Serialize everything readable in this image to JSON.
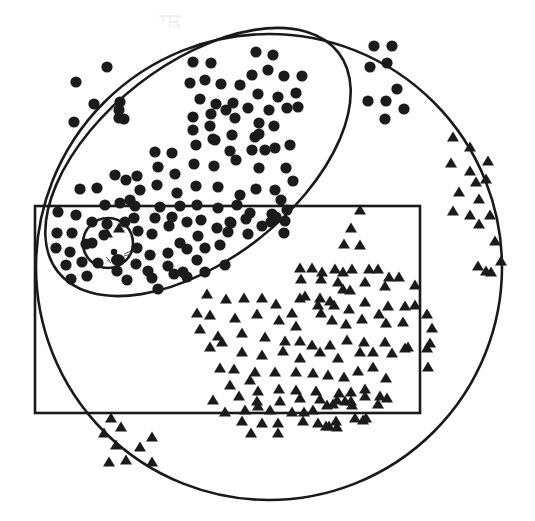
{
  "figure": {
    "colors": {
      "ink": "#1b1b1b",
      "paper": "#ffffff"
    },
    "shapes": {
      "big_circle": {
        "cx": 269,
        "cy": 267,
        "r": 233
      },
      "ellipse": {
        "cx": 198,
        "cy": 162,
        "rx": 178,
        "ry": 98,
        "rotate": -38
      },
      "rectangle": {
        "x": 35,
        "y": 206,
        "width": 385,
        "height": 207
      },
      "small_circle": {
        "cx": 108,
        "cy": 243,
        "r": 25
      }
    },
    "legend": {
      "dot": "filled circle marker",
      "triangle": "filled triangle marker",
      "animal": "small animal glyph (center of small circle)"
    },
    "dots": [
      [
        107,
        67
      ],
      [
        76,
        82
      ],
      [
        120,
        102
      ],
      [
        94,
        104
      ],
      [
        74,
        122
      ],
      [
        119,
        118
      ],
      [
        256,
        52
      ],
      [
        273,
        55
      ],
      [
        193,
        62
      ],
      [
        211,
        63
      ],
      [
        190,
        83
      ],
      [
        205,
        80
      ],
      [
        221,
        84
      ],
      [
        240,
        85
      ],
      [
        252,
        75
      ],
      [
        268,
        70
      ],
      [
        284,
        76
      ],
      [
        302,
        76
      ],
      [
        200,
        99
      ],
      [
        216,
        104
      ],
      [
        233,
        103
      ],
      [
        258,
        94
      ],
      [
        278,
        97
      ],
      [
        296,
        93
      ],
      [
        193,
        117
      ],
      [
        211,
        114
      ],
      [
        226,
        110
      ],
      [
        248,
        108
      ],
      [
        269,
        110
      ],
      [
        287,
        108
      ],
      [
        193,
        130
      ],
      [
        210,
        126
      ],
      [
        235,
        118
      ],
      [
        259,
        123
      ],
      [
        274,
        126
      ],
      [
        298,
        107
      ],
      [
        215,
        140
      ],
      [
        232,
        135
      ],
      [
        255,
        137
      ],
      [
        275,
        148
      ],
      [
        290,
        145
      ],
      [
        155,
        152
      ],
      [
        172,
        153
      ],
      [
        196,
        145
      ],
      [
        213,
        139
      ],
      [
        230,
        151
      ],
      [
        252,
        150
      ],
      [
        265,
        150
      ],
      [
        115,
        175
      ],
      [
        137,
        176
      ],
      [
        158,
        167
      ],
      [
        175,
        174
      ],
      [
        194,
        164
      ],
      [
        214,
        166
      ],
      [
        236,
        160
      ],
      [
        259,
        168
      ],
      [
        286,
        168
      ],
      [
        80,
        189
      ],
      [
        97,
        188
      ],
      [
        126,
        180
      ],
      [
        140,
        190
      ],
      [
        157,
        185
      ],
      [
        177,
        193
      ],
      [
        196,
        186
      ],
      [
        218,
        187
      ],
      [
        240,
        195
      ],
      [
        256,
        189
      ],
      [
        275,
        190
      ],
      [
        293,
        181
      ],
      [
        105,
        205
      ],
      [
        120,
        203
      ],
      [
        135,
        206
      ],
      [
        160,
        207
      ],
      [
        180,
        206
      ],
      [
        197,
        205
      ],
      [
        218,
        208
      ],
      [
        237,
        205
      ],
      [
        250,
        213
      ],
      [
        272,
        214
      ],
      [
        287,
        210
      ],
      [
        58,
        212
      ],
      [
        76,
        215
      ],
      [
        92,
        222
      ],
      [
        107,
        224
      ],
      [
        125,
        222
      ],
      [
        134,
        218
      ],
      [
        155,
        218
      ],
      [
        172,
        217
      ],
      [
        187,
        222
      ],
      [
        201,
        220
      ],
      [
        230,
        222
      ],
      [
        246,
        219
      ],
      [
        271,
        222
      ],
      [
        285,
        221
      ],
      [
        57,
        233
      ],
      [
        72,
        233
      ],
      [
        92,
        243
      ],
      [
        104,
        235
      ],
      [
        138,
        231
      ],
      [
        152,
        234
      ],
      [
        169,
        226
      ],
      [
        180,
        243
      ],
      [
        198,
        236
      ],
      [
        217,
        228
      ],
      [
        231,
        223
      ],
      [
        248,
        234
      ],
      [
        56,
        248
      ],
      [
        70,
        252
      ],
      [
        86,
        244
      ],
      [
        137,
        248
      ],
      [
        150,
        255
      ],
      [
        168,
        253
      ],
      [
        187,
        249
      ],
      [
        205,
        248
      ],
      [
        220,
        245
      ],
      [
        228,
        232
      ],
      [
        66,
        265
      ],
      [
        82,
        262
      ],
      [
        98,
        263
      ],
      [
        136,
        264
      ],
      [
        148,
        271
      ],
      [
        168,
        266
      ],
      [
        183,
        272
      ],
      [
        197,
        260
      ],
      [
        205,
        272
      ],
      [
        225,
        265
      ],
      [
        71,
        279
      ],
      [
        87,
        276
      ],
      [
        117,
        271
      ],
      [
        127,
        280
      ],
      [
        152,
        278
      ],
      [
        158,
        289
      ],
      [
        174,
        274
      ],
      [
        187,
        277
      ],
      [
        119,
        110
      ],
      [
        124,
        119
      ],
      [
        259,
        134
      ],
      [
        130,
        200
      ],
      [
        262,
        226
      ],
      [
        281,
        200
      ],
      [
        374,
        46
      ],
      [
        392,
        46
      ],
      [
        370,
        67
      ],
      [
        387,
        63
      ],
      [
        397,
        89
      ],
      [
        368,
        101
      ],
      [
        386,
        101
      ],
      [
        404,
        109
      ],
      [
        385,
        119
      ],
      [
        276,
        217
      ],
      [
        284,
        233
      ]
    ],
    "triangles": [
      [
        453,
        137
      ],
      [
        470,
        147
      ],
      [
        488,
        161
      ],
      [
        451,
        163
      ],
      [
        470,
        171
      ],
      [
        486,
        179
      ],
      [
        476,
        182
      ],
      [
        459,
        192
      ],
      [
        479,
        199
      ],
      [
        453,
        211
      ],
      [
        470,
        215
      ],
      [
        490,
        215
      ],
      [
        495,
        241
      ],
      [
        479,
        224
      ],
      [
        491,
        272
      ],
      [
        478,
        266
      ],
      [
        501,
        261
      ],
      [
        486,
        271
      ],
      [
        360,
        210
      ],
      [
        351,
        228
      ],
      [
        344,
        244
      ],
      [
        360,
        245
      ],
      [
        322,
        272
      ],
      [
        343,
        272
      ],
      [
        338,
        282
      ],
      [
        320,
        298
      ],
      [
        330,
        301
      ],
      [
        350,
        290
      ],
      [
        305,
        296
      ],
      [
        300,
        268
      ],
      [
        312,
        268
      ],
      [
        335,
        269
      ],
      [
        352,
        269
      ],
      [
        369,
        269
      ],
      [
        378,
        269
      ],
      [
        389,
        277
      ],
      [
        399,
        277
      ],
      [
        301,
        279
      ],
      [
        321,
        279
      ],
      [
        343,
        289
      ],
      [
        365,
        282
      ],
      [
        385,
        286
      ],
      [
        415,
        285
      ],
      [
        207,
        294
      ],
      [
        226,
        299
      ],
      [
        244,
        298
      ],
      [
        262,
        298
      ],
      [
        300,
        298
      ],
      [
        276,
        304
      ],
      [
        292,
        313
      ],
      [
        318,
        305
      ],
      [
        334,
        305
      ],
      [
        349,
        309
      ],
      [
        365,
        302
      ],
      [
        388,
        306
      ],
      [
        405,
        306
      ],
      [
        415,
        305
      ],
      [
        197,
        313
      ],
      [
        210,
        315
      ],
      [
        235,
        318
      ],
      [
        257,
        314
      ],
      [
        279,
        320
      ],
      [
        296,
        326
      ],
      [
        321,
        313
      ],
      [
        332,
        320
      ],
      [
        346,
        324
      ],
      [
        362,
        319
      ],
      [
        379,
        314
      ],
      [
        386,
        323
      ],
      [
        403,
        322
      ],
      [
        427,
        314
      ],
      [
        432,
        328
      ],
      [
        430,
        343
      ],
      [
        200,
        329
      ],
      [
        218,
        336
      ],
      [
        242,
        333
      ],
      [
        265,
        337
      ],
      [
        285,
        341
      ],
      [
        300,
        341
      ],
      [
        312,
        345
      ],
      [
        330,
        345
      ],
      [
        347,
        340
      ],
      [
        364,
        342
      ],
      [
        385,
        342
      ],
      [
        405,
        348
      ],
      [
        210,
        347
      ],
      [
        222,
        342
      ],
      [
        242,
        352
      ],
      [
        262,
        355
      ],
      [
        283,
        351
      ],
      [
        300,
        358
      ],
      [
        320,
        352
      ],
      [
        338,
        358
      ],
      [
        360,
        352
      ],
      [
        373,
        352
      ],
      [
        392,
        353
      ],
      [
        408,
        347
      ],
      [
        427,
        348
      ],
      [
        428,
        367
      ],
      [
        220,
        368
      ],
      [
        234,
        369
      ],
      [
        255,
        372
      ],
      [
        275,
        372
      ],
      [
        296,
        372
      ],
      [
        313,
        373
      ],
      [
        328,
        375
      ],
      [
        344,
        377
      ],
      [
        358,
        371
      ],
      [
        373,
        367
      ],
      [
        386,
        378
      ],
      [
        230,
        385
      ],
      [
        250,
        380
      ],
      [
        258,
        391
      ],
      [
        279,
        389
      ],
      [
        296,
        390
      ],
      [
        316,
        391
      ],
      [
        339,
        393
      ],
      [
        351,
        392
      ],
      [
        365,
        389
      ],
      [
        380,
        396
      ],
      [
        213,
        400
      ],
      [
        239,
        396
      ],
      [
        257,
        401
      ],
      [
        280,
        401
      ],
      [
        300,
        398
      ],
      [
        320,
        399
      ],
      [
        337,
        400
      ],
      [
        351,
        401
      ],
      [
        365,
        396
      ],
      [
        387,
        398
      ],
      [
        225,
        412
      ],
      [
        245,
        410
      ],
      [
        258,
        406
      ],
      [
        270,
        410
      ],
      [
        292,
        412
      ],
      [
        304,
        412
      ],
      [
        313,
        410
      ],
      [
        327,
        405
      ],
      [
        333,
        404
      ],
      [
        345,
        401
      ],
      [
        352,
        405
      ],
      [
        378,
        404
      ],
      [
        242,
        421
      ],
      [
        262,
        423
      ],
      [
        278,
        423
      ],
      [
        303,
        421
      ],
      [
        318,
        423
      ],
      [
        329,
        426
      ],
      [
        336,
        421
      ],
      [
        363,
        420
      ],
      [
        251,
        433
      ],
      [
        278,
        433
      ],
      [
        326,
        426
      ],
      [
        337,
        427
      ],
      [
        355,
        418
      ],
      [
        366,
        418
      ],
      [
        111,
        418
      ],
      [
        121,
        427
      ],
      [
        104,
        433
      ],
      [
        116,
        445
      ],
      [
        140,
        447
      ],
      [
        152,
        437
      ],
      [
        109,
        462
      ],
      [
        126,
        460
      ],
      [
        152,
        462
      ],
      [
        107,
        233
      ],
      [
        119,
        228
      ]
    ],
    "animal": {
      "cx": 118,
      "cy": 258,
      "label": "mouse"
    }
  }
}
